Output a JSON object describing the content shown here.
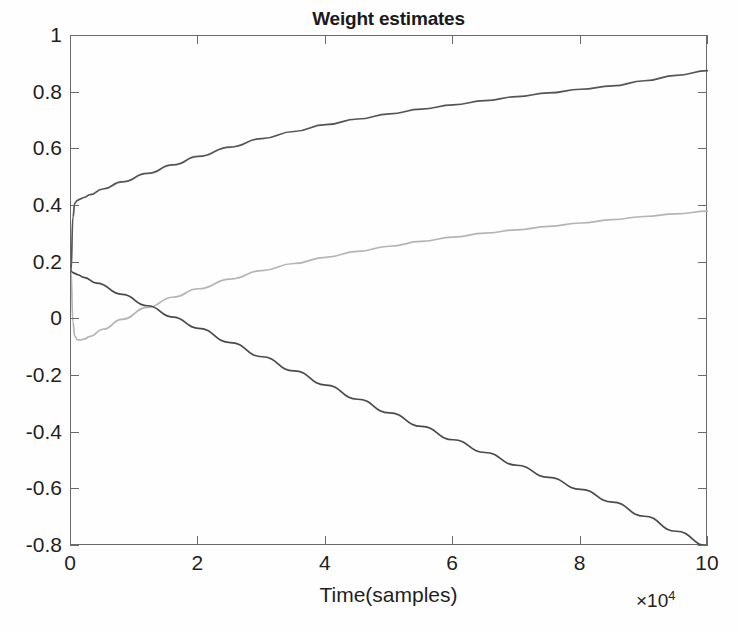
{
  "figure": {
    "background_color": "#ffffff",
    "axis_color": "#6a6a6a",
    "text_color": "#1f1f1f"
  },
  "chart_data": {
    "type": "line",
    "title": "Weight estimates",
    "xlabel": "Time(samples)",
    "ylabel": "",
    "x_exponent_label": "×10",
    "x_exponent_power": "4",
    "xlim": [
      0,
      10
    ],
    "ylim": [
      -0.8,
      1
    ],
    "xticks": [
      0,
      2,
      4,
      6,
      8,
      10
    ],
    "xtick_labels": [
      "0",
      "2",
      "4",
      "6",
      "8",
      "10"
    ],
    "yticks": [
      1,
      0.8,
      0.6,
      0.4,
      0.2,
      0,
      -0.2,
      -0.4,
      -0.6,
      -0.8
    ],
    "ytick_labels": [
      "1",
      "0.8",
      "0.6",
      "0.4",
      "0.2",
      "0",
      "-0.2",
      "-0.4",
      "-0.6",
      "-0.8"
    ],
    "grid": false,
    "legend": null,
    "legend_position": "none",
    "x_units": "10^4 samples",
    "series": [
      {
        "name": "weight-1",
        "color": "#555555",
        "line_width": 1.7,
        "x": [
          0,
          0.03,
          0.06,
          0.1,
          0.15,
          0.2,
          0.3,
          0.5,
          0.8,
          1.2,
          1.6,
          2.0,
          2.5,
          3.0,
          3.5,
          4.0,
          4.5,
          5.0,
          5.5,
          6.0,
          6.5,
          7.0,
          7.5,
          8.0,
          8.5,
          9.0,
          9.5,
          10.0
        ],
        "y": [
          0.17,
          0.36,
          0.41,
          0.42,
          0.425,
          0.43,
          0.44,
          0.46,
          0.485,
          0.515,
          0.545,
          0.575,
          0.608,
          0.638,
          0.663,
          0.687,
          0.707,
          0.725,
          0.742,
          0.757,
          0.772,
          0.786,
          0.799,
          0.812,
          0.824,
          0.842,
          0.861,
          0.878
        ]
      },
      {
        "name": "weight-2",
        "color": "#b4b4b4",
        "line_width": 1.7,
        "x": [
          0,
          0.03,
          0.06,
          0.1,
          0.15,
          0.2,
          0.3,
          0.5,
          0.8,
          1.2,
          1.6,
          2.0,
          2.5,
          3.0,
          3.5,
          4.0,
          4.5,
          5.0,
          5.5,
          6.0,
          6.5,
          7.0,
          7.5,
          8.0,
          8.5,
          9.0,
          9.5,
          10.0
        ],
        "y": [
          0.17,
          -0.01,
          -0.06,
          -0.072,
          -0.073,
          -0.07,
          -0.06,
          -0.035,
          0.0,
          0.042,
          0.078,
          0.108,
          0.142,
          0.172,
          0.197,
          0.219,
          0.24,
          0.258,
          0.275,
          0.29,
          0.304,
          0.316,
          0.328,
          0.34,
          0.352,
          0.363,
          0.372,
          0.382
        ]
      },
      {
        "name": "weight-3",
        "color": "#4a4a4a",
        "line_width": 1.7,
        "x": [
          0,
          0.03,
          0.06,
          0.1,
          0.2,
          0.4,
          0.8,
          1.2,
          1.6,
          2.0,
          2.5,
          3.0,
          3.5,
          4.0,
          4.5,
          5.0,
          5.5,
          6.0,
          6.5,
          7.0,
          7.5,
          8.0,
          8.5,
          9.0,
          9.5,
          10.0
        ],
        "y": [
          0.17,
          0.165,
          0.162,
          0.158,
          0.148,
          0.128,
          0.088,
          0.048,
          0.008,
          -0.032,
          -0.082,
          -0.132,
          -0.182,
          -0.232,
          -0.282,
          -0.33,
          -0.378,
          -0.425,
          -0.47,
          -0.515,
          -0.558,
          -0.6,
          -0.645,
          -0.695,
          -0.748,
          -0.8
        ]
      }
    ]
  }
}
